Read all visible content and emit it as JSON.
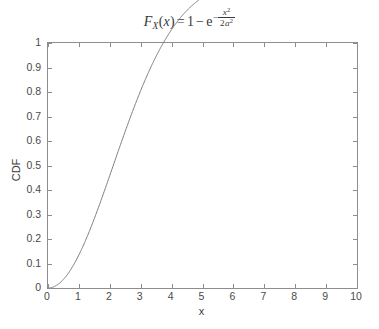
{
  "chart_data": {
    "type": "line",
    "title_parts": {
      "f": "F",
      "f_sub": "X",
      "open": "(",
      "var": "x",
      "close": ")",
      "equals": "=",
      "one": "1",
      "minus": "−",
      "e": "e",
      "exp_sign": "−",
      "exp_num_var": "x",
      "exp_num_pow": "2",
      "exp_den_coef": "2",
      "exp_den_var": "a",
      "exp_den_pow": "2"
    },
    "xlabel": "x",
    "ylabel": "CDF",
    "xlim": [
      0,
      10
    ],
    "ylim": [
      0,
      1
    ],
    "grid": false,
    "legend": null,
    "line_color": "#7d7d7d",
    "axis_color": "#8d8d8d",
    "background": "#ffffff",
    "distribution": "Rayleigh CDF",
    "parameter_a": 2.1,
    "xticks": [
      "0",
      "1",
      "2",
      "3",
      "4",
      "5",
      "6",
      "7",
      "8",
      "9",
      "10"
    ],
    "xtick_values": [
      0,
      1,
      2,
      3,
      4,
      5,
      6,
      7,
      8,
      9,
      10
    ],
    "yticks": [
      "0",
      "0.1",
      "0.2",
      "0.3",
      "0.4",
      "0.5",
      "0.6",
      "0.7",
      "0.8",
      "0.9",
      "1"
    ],
    "ytick_values": [
      0,
      0.1,
      0.2,
      0.3,
      0.4,
      0.5,
      0.6,
      0.7,
      0.8,
      0.9,
      1
    ],
    "x": [
      0,
      0.25,
      0.5,
      0.75,
      1,
      1.25,
      1.5,
      1.75,
      2,
      2.25,
      2.5,
      2.75,
      3,
      3.25,
      3.5,
      3.75,
      4,
      4.25,
      4.5,
      4.75,
      5,
      5.25,
      5.5,
      5.75,
      6,
      6.5,
      7,
      7.5,
      8,
      8.5,
      9,
      9.5,
      10
    ],
    "y": [
      0,
      0.0035,
      0.014,
      0.0313,
      0.0548,
      0.0842,
      0.1186,
      0.1573,
      0.1993,
      0.2437,
      0.2895,
      0.3357,
      0.3815,
      0.4262,
      0.4689,
      0.5093,
      0.5468,
      0.5812,
      0.6124,
      0.6403,
      0.6648,
      0.6862,
      0.7047,
      0.7204,
      0.7337,
      0.7541,
      0.7682,
      0.7778,
      0.7841,
      0.7882,
      0.7908,
      0.7925,
      0.7935
    ]
  }
}
